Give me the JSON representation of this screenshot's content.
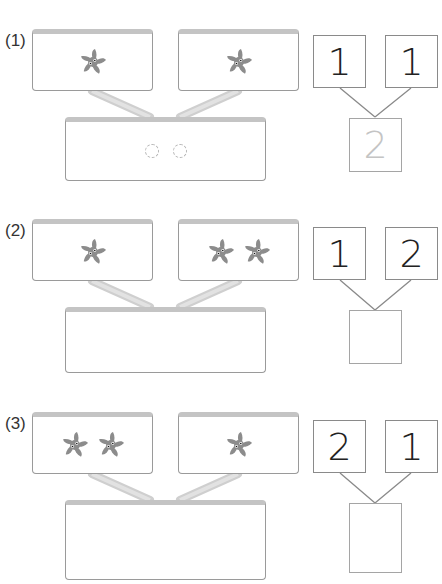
{
  "problems": [
    {
      "label": "(1)",
      "left_count": 1,
      "right_count": 1,
      "number_left": "1",
      "number_right": "1",
      "sum_hint": "2",
      "bottom_dashed_circles": 2
    },
    {
      "label": "(2)",
      "left_count": 1,
      "right_count": 2,
      "number_left": "1",
      "number_right": "2",
      "sum_hint": "",
      "bottom_dashed_circles": 0
    },
    {
      "label": "(3)",
      "left_count": 2,
      "right_count": 1,
      "number_left": "2",
      "number_right": "1",
      "sum_hint": "",
      "bottom_dashed_circles": 0
    }
  ],
  "icons": {
    "item": "pinwheel-icon"
  },
  "colors": {
    "pinwheel": "#8c8c8c",
    "card_border": "#9a9a9a",
    "card_top": "#c4c4c4",
    "hint_text": "#c4c4c4"
  }
}
